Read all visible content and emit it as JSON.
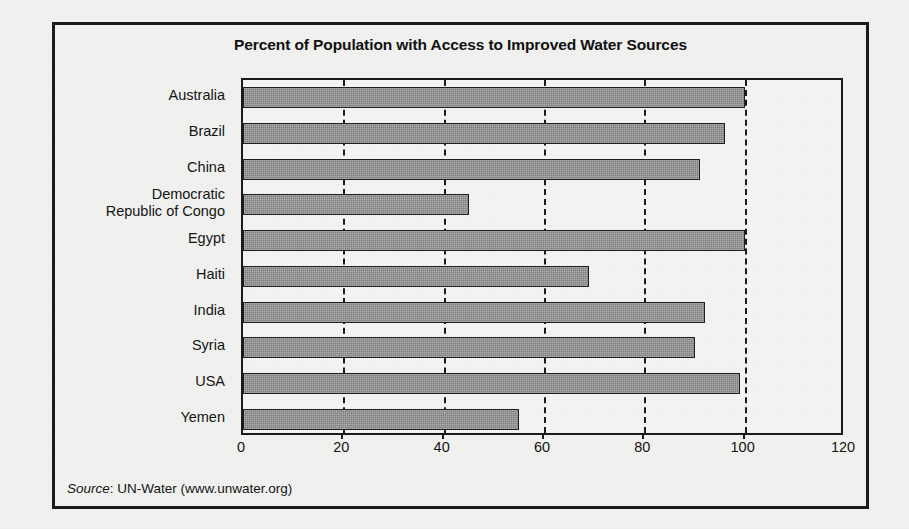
{
  "figure": {
    "title": "Percent of Population with Access to Improved Water Sources",
    "source_label": "Source",
    "source_separator": ": ",
    "source_text": "UN-Water (www.unwater.org)"
  },
  "chart_data": {
    "type": "bar",
    "orientation": "horizontal",
    "title": "Percent of Population with Access to Improved Water Sources",
    "xlabel": "",
    "ylabel": "",
    "xlim": [
      0,
      120
    ],
    "xticks": [
      0,
      20,
      40,
      60,
      80,
      100,
      120
    ],
    "xtick_labels": [
      "0",
      "20",
      "40",
      "60",
      "80",
      "100",
      "120"
    ],
    "grid": "vertical-dashed",
    "legend": "none",
    "categories": [
      "Australia",
      "Brazil",
      "China",
      "Democratic\nRepublic of Congo",
      "Egypt",
      "Haiti",
      "India",
      "Syria",
      "USA",
      "Yemen"
    ],
    "values": [
      100,
      96,
      91,
      45,
      100,
      69,
      92,
      90,
      99,
      55
    ],
    "series": [
      {
        "name": "Percent of population with access to improved water sources",
        "values": [
          100,
          96,
          91,
          45,
          100,
          69,
          92,
          90,
          99,
          55
        ]
      }
    ],
    "bar_fill_color": "#8d8d8d",
    "bar_border_color": "#1e1e1e",
    "gridline_color": "#1b1b1b",
    "axis_color": "#1b1b1b",
    "background_color": "#f2f2f0"
  }
}
